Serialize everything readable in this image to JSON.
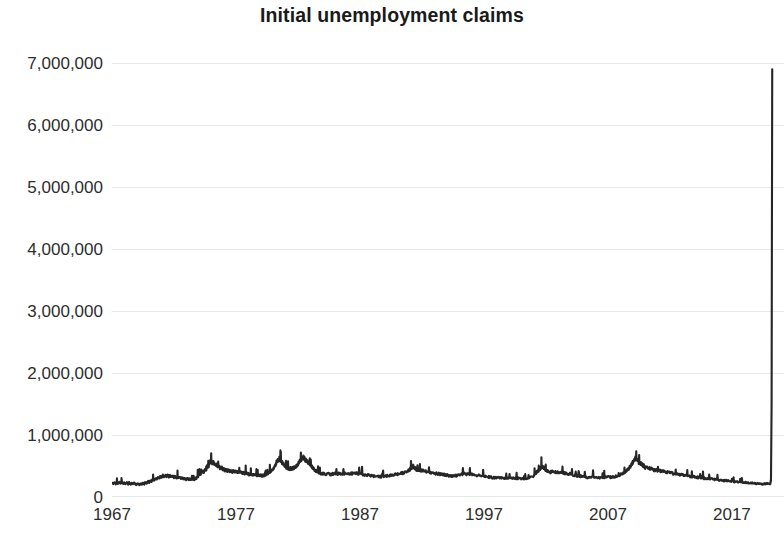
{
  "chart_data": {
    "type": "line",
    "title": "Initial unemployment claims",
    "xlabel": "",
    "ylabel": "",
    "grid": true,
    "legend": null,
    "legend_position": "none",
    "line_color": "#262626",
    "gridline_color": "#e8e8e8",
    "background_color": "#ffffff",
    "xlim": [
      1967,
      2021.2
    ],
    "ylim": [
      0,
      7000000
    ],
    "x_tick_labels": [
      "1967",
      "1977",
      "1987",
      "1997",
      "2007",
      "2017"
    ],
    "x_tick_values": [
      1967,
      1977,
      1987,
      1997,
      2007,
      2017
    ],
    "y_tick_labels": [
      "0",
      "1,000,000",
      "2,000,000",
      "3,000,000",
      "4,000,000",
      "5,000,000",
      "6,000,000",
      "7,000,000"
    ],
    "y_tick_values": [
      0,
      1000000,
      2000000,
      3000000,
      4000000,
      5000000,
      6000000,
      7000000
    ],
    "series": [
      {
        "name": "Initial unemployment claims",
        "x": [
          1967.0,
          1967.1,
          1967.2,
          1967.3,
          1967.4,
          1967.5,
          1967.6,
          1967.7,
          1967.8,
          1967.9,
          1968.0,
          1968.1,
          1968.2,
          1968.3,
          1968.4,
          1968.5,
          1968.6,
          1968.7,
          1968.8,
          1968.9,
          1969.0,
          1969.1,
          1969.2,
          1969.3,
          1969.4,
          1969.5,
          1969.6,
          1969.7,
          1969.8,
          1969.9,
          1970.0,
          1970.1,
          1970.2,
          1970.3,
          1970.4,
          1970.5,
          1970.6,
          1970.7,
          1970.8,
          1970.9,
          1971.0,
          1971.1,
          1971.2,
          1971.3,
          1971.4,
          1971.5,
          1971.6,
          1971.7,
          1971.8,
          1971.9,
          1972.0,
          1972.1,
          1972.2,
          1972.3,
          1972.4,
          1972.5,
          1972.6,
          1972.7,
          1972.8,
          1972.9,
          1973.0,
          1973.1,
          1973.2,
          1973.3,
          1973.4,
          1973.5,
          1973.6,
          1973.7,
          1973.8,
          1973.9,
          1974.0,
          1974.1,
          1974.2,
          1974.3,
          1974.4,
          1974.5,
          1974.6,
          1974.7,
          1974.8,
          1974.9,
          1975.0,
          1975.1,
          1975.2,
          1975.3,
          1975.4,
          1975.5,
          1975.6,
          1975.7,
          1975.8,
          1975.9,
          1976.0,
          1976.1,
          1976.2,
          1976.3,
          1976.4,
          1976.5,
          1976.6,
          1976.7,
          1976.8,
          1976.9,
          1977.0,
          1977.1,
          1977.2,
          1977.3,
          1977.4,
          1977.5,
          1977.6,
          1977.7,
          1977.8,
          1977.9,
          1978.0,
          1978.1,
          1978.2,
          1978.3,
          1978.4,
          1978.5,
          1978.6,
          1978.7,
          1978.8,
          1978.9,
          1979.0,
          1979.1,
          1979.2,
          1979.3,
          1979.4,
          1979.5,
          1979.6,
          1979.7,
          1979.8,
          1979.9,
          1980.0,
          1980.1,
          1980.2,
          1980.3,
          1980.4,
          1980.5,
          1980.6,
          1980.7,
          1980.8,
          1980.9,
          1981.0,
          1981.1,
          1981.2,
          1981.3,
          1981.4,
          1981.5,
          1981.6,
          1981.7,
          1981.8,
          1981.9,
          1982.0,
          1982.1,
          1982.2,
          1982.3,
          1982.4,
          1982.5,
          1982.6,
          1982.7,
          1982.8,
          1982.9,
          1983.0,
          1983.1,
          1983.2,
          1983.3,
          1983.4,
          1983.5,
          1983.6,
          1983.7,
          1983.8,
          1983.9,
          1984.0,
          1984.2,
          1984.4,
          1984.6,
          1984.8,
          1985.0,
          1985.2,
          1985.4,
          1985.6,
          1985.8,
          1986.0,
          1986.2,
          1986.4,
          1986.6,
          1986.8,
          1987.0,
          1987.2,
          1987.4,
          1987.6,
          1987.8,
          1988.0,
          1988.2,
          1988.4,
          1988.6,
          1988.8,
          1989.0,
          1989.2,
          1989.4,
          1989.6,
          1989.8,
          1990.0,
          1990.2,
          1990.4,
          1990.6,
          1990.8,
          1991.0,
          1991.1,
          1991.2,
          1991.3,
          1991.4,
          1991.5,
          1991.6,
          1991.7,
          1991.8,
          1991.9,
          1992.0,
          1992.2,
          1992.4,
          1992.6,
          1992.8,
          1993.0,
          1993.2,
          1993.4,
          1993.6,
          1993.8,
          1994.0,
          1994.2,
          1994.4,
          1994.6,
          1994.8,
          1995.0,
          1995.2,
          1995.4,
          1995.6,
          1995.8,
          1996.0,
          1996.2,
          1996.4,
          1996.6,
          1996.8,
          1997.0,
          1997.2,
          1997.4,
          1997.6,
          1997.8,
          1998.0,
          1998.2,
          1998.4,
          1998.6,
          1998.8,
          1999.0,
          1999.2,
          1999.4,
          1999.6,
          1999.8,
          2000.0,
          2000.2,
          2000.4,
          2000.6,
          2000.8,
          2001.0,
          2001.1,
          2001.2,
          2001.3,
          2001.4,
          2001.5,
          2001.6,
          2001.7,
          2001.8,
          2001.9,
          2002.0,
          2002.2,
          2002.4,
          2002.6,
          2002.8,
          2003.0,
          2003.2,
          2003.4,
          2003.6,
          2003.8,
          2004.0,
          2004.2,
          2004.4,
          2004.6,
          2004.8,
          2005.0,
          2005.2,
          2005.4,
          2005.6,
          2005.8,
          2006.0,
          2006.2,
          2006.4,
          2006.6,
          2006.8,
          2007.0,
          2007.2,
          2007.4,
          2007.6,
          2007.8,
          2008.0,
          2008.1,
          2008.2,
          2008.3,
          2008.4,
          2008.5,
          2008.6,
          2008.7,
          2008.8,
          2008.9,
          2009.0,
          2009.1,
          2009.2,
          2009.3,
          2009.4,
          2009.5,
          2009.6,
          2009.7,
          2009.8,
          2009.9,
          2010.0,
          2010.2,
          2010.4,
          2010.6,
          2010.8,
          2011.0,
          2011.2,
          2011.4,
          2011.6,
          2011.8,
          2012.0,
          2012.2,
          2012.4,
          2012.6,
          2012.8,
          2013.0,
          2013.2,
          2013.4,
          2013.6,
          2013.8,
          2014.0,
          2014.2,
          2014.4,
          2014.6,
          2014.8,
          2015.0,
          2015.2,
          2015.4,
          2015.6,
          2015.8,
          2016.0,
          2016.2,
          2016.4,
          2016.6,
          2016.8,
          2017.0,
          2017.2,
          2017.4,
          2017.6,
          2017.8,
          2018.0,
          2018.2,
          2018.4,
          2018.6,
          2018.8,
          2019.0,
          2019.2,
          2019.4,
          2019.6,
          2019.8,
          2020.0,
          2020.1,
          2020.15,
          2020.2,
          2020.25
        ],
        "values": [
          221000,
          215000,
          228000,
          210000,
          232000,
          218000,
          240000,
          225000,
          235000,
          219000,
          228000,
          213000,
          236000,
          208000,
          222000,
          205000,
          230000,
          212000,
          224000,
          207000,
          200000,
          212000,
          198000,
          218000,
          205000,
          225000,
          210000,
          238000,
          222000,
          248000,
          240000,
          262000,
          255000,
          285000,
          272000,
          300000,
          290000,
          318000,
          305000,
          330000,
          325000,
          345000,
          332000,
          352000,
          338000,
          348000,
          330000,
          342000,
          325000,
          335000,
          318000,
          328000,
          310000,
          322000,
          305000,
          315000,
          298000,
          308000,
          292000,
          300000,
          285000,
          296000,
          280000,
          292000,
          278000,
          290000,
          276000,
          300000,
          295000,
          330000,
          340000,
          375000,
          365000,
          410000,
          400000,
          450000,
          440000,
          510000,
          495000,
          575000,
          580000,
          545000,
          560000,
          520000,
          530000,
          495000,
          500000,
          470000,
          478000,
          455000,
          448000,
          435000,
          442000,
          425000,
          432000,
          418000,
          425000,
          412000,
          420000,
          408000,
          412000,
          398000,
          405000,
          392000,
          400000,
          388000,
          395000,
          382000,
          390000,
          378000,
          372000,
          362000,
          368000,
          355000,
          362000,
          350000,
          358000,
          348000,
          355000,
          345000,
          350000,
          342000,
          348000,
          352000,
          360000,
          372000,
          385000,
          398000,
          410000,
          430000,
          450000,
          490000,
          530000,
          570000,
          600000,
          620000,
          590000,
          560000,
          530000,
          500000,
          480000,
          465000,
          458000,
          452000,
          460000,
          455000,
          468000,
          475000,
          490000,
          510000,
          530000,
          560000,
          590000,
          625000,
          640000,
          620000,
          600000,
          580000,
          560000,
          540000,
          520000,
          495000,
          470000,
          450000,
          430000,
          415000,
          400000,
          392000,
          385000,
          380000,
          375000,
          368000,
          372000,
          365000,
          370000,
          378000,
          372000,
          380000,
          374000,
          382000,
          385000,
          378000,
          382000,
          375000,
          380000,
          372000,
          365000,
          360000,
          352000,
          348000,
          342000,
          335000,
          330000,
          325000,
          330000,
          335000,
          340000,
          345000,
          352000,
          360000,
          368000,
          378000,
          385000,
          398000,
          412000,
          440000,
          465000,
          480000,
          495000,
          470000,
          455000,
          440000,
          448000,
          432000,
          440000,
          425000,
          418000,
          408000,
          400000,
          392000,
          385000,
          378000,
          372000,
          365000,
          358000,
          352000,
          345000,
          340000,
          348000,
          342000,
          355000,
          368000,
          375000,
          365000,
          372000,
          365000,
          358000,
          352000,
          345000,
          340000,
          335000,
          328000,
          322000,
          318000,
          312000,
          315000,
          308000,
          312000,
          305000,
          310000,
          305000,
          300000,
          305000,
          298000,
          302000,
          298000,
          292000,
          300000,
          308000,
          320000,
          340000,
          365000,
          385000,
          410000,
          430000,
          452000,
          475000,
          490000,
          478000,
          465000,
          420000,
          412000,
          400000,
          408000,
          395000,
          402000,
          395000,
          388000,
          382000,
          375000,
          368000,
          355000,
          348000,
          342000,
          335000,
          330000,
          322000,
          318000,
          325000,
          330000,
          318000,
          312000,
          308000,
          315000,
          320000,
          325000,
          318000,
          322000,
          330000,
          345000,
          360000,
          375000,
          382000,
          395000,
          408000,
          420000,
          440000,
          465000,
          490000,
          520000,
          560000,
          600000,
          630000,
          610000,
          580000,
          560000,
          545000,
          530000,
          515000,
          500000,
          478000,
          465000,
          458000,
          445000,
          438000,
          428000,
          420000,
          412000,
          405000,
          398000,
          390000,
          382000,
          375000,
          368000,
          360000,
          355000,
          348000,
          342000,
          335000,
          330000,
          325000,
          318000,
          312000,
          308000,
          302000,
          298000,
          292000,
          288000,
          282000,
          278000,
          272000,
          268000,
          265000,
          262000,
          258000,
          252000,
          248000,
          245000,
          242000,
          240000,
          235000,
          232000,
          228000,
          225000,
          222000,
          218000,
          215000,
          212000,
          210000,
          216000,
          212000,
          220000,
          280000,
          1500000,
          6900000
        ]
      }
    ],
    "annotations": [
      {
        "label": "COVID-19 spike clipped at right edge of plot",
        "x": 2020.2
      }
    ]
  },
  "axis": {
    "y_labels": [
      "7,000,000",
      "6,000,000",
      "5,000,000",
      "4,000,000",
      "3,000,000",
      "2,000,000",
      "1,000,000",
      "0"
    ],
    "x_labels": [
      "1967",
      "1977",
      "1987",
      "1997",
      "2007",
      "2017"
    ]
  }
}
